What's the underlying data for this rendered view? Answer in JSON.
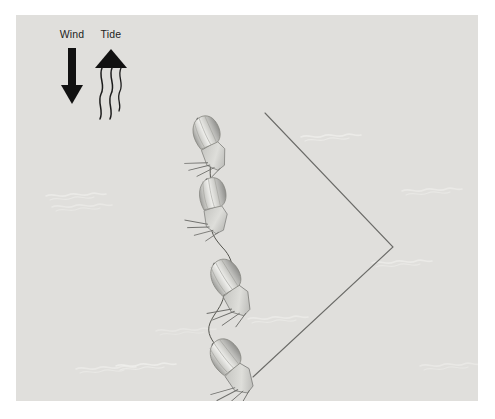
{
  "figure": {
    "background_color": "#e2e1de",
    "page_color": "#ffffff",
    "panel": {
      "x": 16,
      "y": 15,
      "width": 462,
      "height": 386
    }
  },
  "annotations": {
    "wind": {
      "label": "Wind",
      "label_x": 56,
      "label_y": 23,
      "arrow_direction": "down",
      "arrow_color": "#111111",
      "shaft_x": 56,
      "shaft_top": 33,
      "shaft_bottom": 72,
      "shaft_width": 8,
      "head_half_width": 11,
      "head_tip_y": 89
    },
    "tide": {
      "label": "Tide",
      "label_x": 95,
      "label_y": 23,
      "arrow_direction": "up",
      "arrow_color": "#111111",
      "head_tip_x": 95,
      "head_tip_y": 36,
      "head_half_width": 16,
      "head_base_y": 52,
      "wave_count": 3,
      "wave_color": "#1c1c1c"
    }
  },
  "layline": {
    "description": "V-shaped layline chevron pointing right",
    "color": "#6b6b68",
    "stroke_width": 1.1,
    "points": [
      {
        "x": 249,
        "y": 98
      },
      {
        "x": 377,
        "y": 232
      },
      {
        "x": 237,
        "y": 362
      }
    ]
  },
  "track": {
    "description": "wiggly course line connecting the boats",
    "color": "#4a4a48",
    "stroke_width": 1.0
  },
  "boats": [
    {
      "id": "boat-1",
      "label": "boat-upper",
      "x": 192,
      "y": 128,
      "rotation": -24,
      "scale": 1.0
    },
    {
      "id": "boat-2",
      "label": "boat-upper-middle",
      "x": 196,
      "y": 190,
      "rotation": -12,
      "scale": 1.0
    },
    {
      "id": "boat-3",
      "label": "boat-lower-middle",
      "x": 213,
      "y": 273,
      "rotation": -32,
      "scale": 1.08
    },
    {
      "id": "boat-4",
      "label": "boat-lower",
      "x": 214,
      "y": 352,
      "rotation": -38,
      "scale": 1.08
    }
  ],
  "waves": [
    {
      "id": "wave-1",
      "x": 30,
      "y": 175,
      "width": 54,
      "opacity": 0.55
    },
    {
      "id": "wave-2",
      "x": 36,
      "y": 186,
      "width": 46,
      "opacity": 0.45
    },
    {
      "id": "wave-3",
      "x": 285,
      "y": 116,
      "width": 66,
      "opacity": 0.6
    },
    {
      "id": "wave-4",
      "x": 386,
      "y": 170,
      "width": 54,
      "opacity": 0.5
    },
    {
      "id": "wave-5",
      "x": 356,
      "y": 242,
      "width": 62,
      "opacity": 0.55
    },
    {
      "id": "wave-6",
      "x": 232,
      "y": 298,
      "width": 52,
      "opacity": 0.5
    },
    {
      "id": "wave-7",
      "x": 100,
      "y": 345,
      "width": 84,
      "opacity": 0.6
    },
    {
      "id": "wave-8",
      "x": 404,
      "y": 345,
      "width": 52,
      "opacity": 0.45
    },
    {
      "id": "wave-9",
      "x": 140,
      "y": 310,
      "width": 36,
      "opacity": 0.35
    }
  ]
}
